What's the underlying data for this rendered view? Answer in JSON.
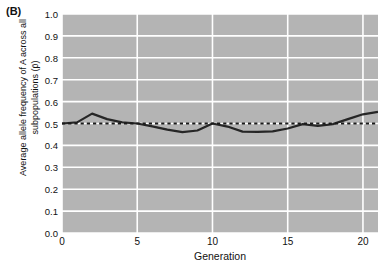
{
  "panel": {
    "label": "(B)"
  },
  "chart_data": {
    "type": "line",
    "title": "",
    "subtitle": "",
    "xlabel": "Generation",
    "ylabel": "Average allele frequency of A across all subpopulations (p̄)",
    "xlim": [
      0,
      21
    ],
    "ylim": [
      0.0,
      1.0
    ],
    "xticks": [
      0,
      5,
      10,
      15,
      20
    ],
    "xtick_labels": [
      "0",
      "5",
      "10",
      "15",
      "20"
    ],
    "yticks": [
      0.0,
      0.1,
      0.2,
      0.3,
      0.4,
      0.5,
      0.6,
      0.7,
      0.8,
      0.9,
      1.0
    ],
    "ytick_labels": [
      "0.0",
      "0.1",
      "0.2",
      "0.3",
      "0.4",
      "0.5",
      "0.6",
      "0.7",
      "0.8",
      "0.9",
      "1.0"
    ],
    "grid": true,
    "grid_color": "#ffffff",
    "plot_background": "#b4b4b4",
    "legend": null,
    "legend_position": "none",
    "series": [
      {
        "name": "Average allele frequency",
        "style": "solid",
        "color": "#262626",
        "x": [
          0,
          1,
          2,
          3,
          4,
          5,
          6,
          7,
          8,
          9,
          10,
          11,
          12,
          13,
          14,
          15,
          16,
          17,
          18,
          19,
          20,
          21
        ],
        "values": [
          0.5,
          0.505,
          0.545,
          0.52,
          0.505,
          0.5,
          0.487,
          0.472,
          0.461,
          0.468,
          0.5,
          0.486,
          0.463,
          0.462,
          0.464,
          0.477,
          0.497,
          0.489,
          0.497,
          0.52,
          0.542,
          0.553
        ]
      },
      {
        "name": "Initial allele frequency reference",
        "style": "dashed",
        "color": "#1a1a1a",
        "constant_y": 0.5,
        "x": [
          0,
          21
        ],
        "values": [
          0.5,
          0.5
        ]
      }
    ]
  }
}
